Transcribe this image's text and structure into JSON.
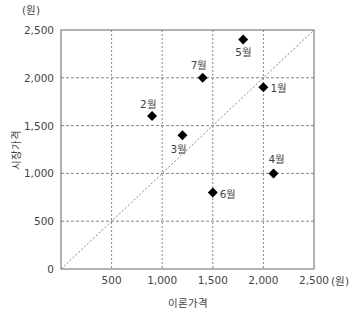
{
  "chart_data": {
    "type": "scatter",
    "title": "",
    "xlabel": "이론가격",
    "ylabel": "시장가격",
    "x_unit": "(원)",
    "y_unit": "(원)",
    "xlim": [
      0,
      2500
    ],
    "ylim": [
      0,
      2500
    ],
    "x_ticks": [
      "500",
      "1,000",
      "1,500",
      "2,000",
      "2,500"
    ],
    "y_ticks": [
      "0",
      "500",
      "1,000",
      "1,500",
      "2,000",
      "2,500"
    ],
    "grid": true,
    "reference_line": "y = x (dotted diagonal)",
    "points": [
      {
        "label": "1월",
        "x": 2000,
        "y": 1900
      },
      {
        "label": "2월",
        "x": 900,
        "y": 1600
      },
      {
        "label": "3월",
        "x": 1200,
        "y": 1400
      },
      {
        "label": "4월",
        "x": 2100,
        "y": 1000
      },
      {
        "label": "5월",
        "x": 1800,
        "y": 2400
      },
      {
        "label": "6월",
        "x": 1500,
        "y": 800
      },
      {
        "label": "7월",
        "x": 1400,
        "y": 2000
      }
    ],
    "marker": "diamond",
    "marker_color": "#000000"
  }
}
